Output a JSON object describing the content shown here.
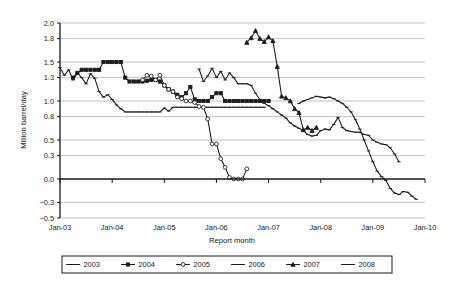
{
  "chart_data": {
    "type": "line",
    "title": "",
    "xlabel": "Report month",
    "ylabel": "Million barrel/day",
    "ylim": [
      -0.5,
      2.0
    ],
    "xlim": [
      2003.0,
      2010.0
    ],
    "grid": true,
    "legend_position": "bottom",
    "y_ticks": [
      "2.0",
      "1.8",
      "1.5",
      "1.3",
      "1.0",
      "0.8",
      "0.5",
      "0.3",
      "0.0",
      "-0.3",
      "-0.5"
    ],
    "y_tick_values": [
      2.0,
      1.8,
      1.5,
      1.3,
      1.0,
      0.8,
      0.5,
      0.3,
      0.0,
      -0.3,
      -0.5
    ],
    "x_ticks": [
      "Jan-03",
      "Jan-04",
      "Jan-05",
      "Jan-06",
      "Jan-07",
      "Jan-08",
      "Jan-09",
      "Jan-10"
    ],
    "x_tick_values": [
      2003,
      2004,
      2005,
      2006,
      2007,
      2008,
      2009,
      2010
    ],
    "series": [
      {
        "name": "2003",
        "marker": "dash",
        "x": [
          2003.0,
          2003.083,
          2003.167,
          2003.25,
          2003.333,
          2003.417,
          2003.5,
          2003.583,
          2003.667,
          2003.75,
          2003.833,
          2003.917,
          2004.0,
          2004.083,
          2004.167,
          2004.25,
          2004.333,
          2004.417,
          2004.5,
          2004.583,
          2004.667,
          2004.75,
          2004.833,
          2004.917,
          2005.0,
          2005.083,
          2005.167,
          2005.25,
          2005.333,
          2005.417,
          2005.5,
          2005.583,
          2005.667,
          2005.75,
          2005.833,
          2005.917,
          2006.0,
          2006.083,
          2006.167,
          2006.25,
          2006.333,
          2006.417,
          2006.5,
          2006.583,
          2006.667,
          2006.75,
          2006.833,
          2006.917
        ],
        "values": [
          1.43,
          1.33,
          1.4,
          1.27,
          1.36,
          1.3,
          1.22,
          1.35,
          1.29,
          1.12,
          1.05,
          1.08,
          1.02,
          0.95,
          0.9,
          0.86,
          0.86,
          0.86,
          0.86,
          0.86,
          0.86,
          0.86,
          0.86,
          0.86,
          0.91,
          0.87,
          0.92,
          0.92,
          0.92,
          0.92,
          0.92,
          0.92,
          0.92,
          0.92,
          0.92,
          0.92,
          0.92,
          0.92,
          0.92,
          0.92,
          0.92,
          0.92,
          0.92,
          0.92,
          0.92,
          0.92,
          0.92,
          0.92
        ]
      },
      {
        "name": "2004",
        "marker": "square",
        "x": [
          2003.25,
          2003.333,
          2003.417,
          2003.5,
          2003.583,
          2003.667,
          2003.75,
          2003.833,
          2003.917,
          2004.0,
          2004.083,
          2004.167,
          2004.25,
          2004.333,
          2004.417,
          2004.5,
          2004.583,
          2004.667,
          2004.75,
          2004.833,
          2004.917,
          2005.0,
          2005.083,
          2005.167,
          2005.25,
          2005.333,
          2005.417,
          2005.5,
          2005.583,
          2005.667,
          2005.75,
          2005.833,
          2005.917,
          2006.0,
          2006.083,
          2006.167,
          2006.25,
          2006.333,
          2006.417,
          2006.5,
          2006.583,
          2006.667,
          2006.75,
          2006.833,
          2006.917,
          2007.0
        ],
        "values": [
          1.3,
          1.36,
          1.4,
          1.4,
          1.4,
          1.4,
          1.4,
          1.5,
          1.5,
          1.5,
          1.5,
          1.5,
          1.3,
          1.25,
          1.25,
          1.25,
          1.25,
          1.26,
          1.27,
          1.27,
          1.25,
          1.2,
          1.15,
          1.12,
          1.08,
          1.05,
          1.1,
          1.18,
          1.02,
          1.0,
          1.0,
          1.0,
          1.05,
          1.1,
          1.1,
          1.0,
          1.0,
          1.0,
          1.0,
          1.0,
          1.0,
          1.0,
          1.0,
          1.0,
          1.0,
          1.0
        ]
      },
      {
        "name": "2005",
        "marker": "circle-open",
        "x": [
          2004.583,
          2004.667,
          2004.75,
          2004.833,
          2004.917,
          2005.0,
          2005.083,
          2005.167,
          2005.25,
          2005.333,
          2005.417,
          2005.5,
          2005.583,
          2005.667,
          2005.75,
          2005.833,
          2005.917,
          2006.0,
          2006.083,
          2006.167,
          2006.25,
          2006.333,
          2006.417,
          2006.5,
          2006.583
        ],
        "values": [
          1.27,
          1.33,
          1.32,
          1.27,
          1.33,
          1.2,
          1.15,
          1.12,
          1.05,
          1.03,
          1.0,
          1.0,
          0.98,
          0.93,
          0.92,
          0.77,
          0.45,
          0.45,
          0.26,
          0.15,
          0.02,
          0.0,
          0.0,
          0.0,
          0.13
        ]
      },
      {
        "name": "2006",
        "marker": "dash",
        "x": [
          2005.667,
          2005.75,
          2005.833,
          2005.917,
          2006.0,
          2006.083,
          2006.167,
          2006.25,
          2006.333,
          2006.417,
          2006.5,
          2006.583,
          2006.667,
          2006.75,
          2006.833,
          2006.917,
          2007.0,
          2007.083,
          2007.167,
          2007.25,
          2007.333,
          2007.417,
          2007.5,
          2007.583,
          2007.667,
          2007.75,
          2007.833,
          2007.917,
          2008.0,
          2008.083,
          2008.167,
          2008.25,
          2008.333,
          2008.417,
          2008.5,
          2008.583,
          2008.667,
          2008.75,
          2008.833,
          2008.917,
          2009.0,
          2009.083,
          2009.167,
          2009.25,
          2009.333,
          2009.417,
          2009.5
        ],
        "values": [
          1.41,
          1.25,
          1.32,
          1.42,
          1.3,
          1.38,
          1.27,
          1.36,
          1.3,
          1.22,
          1.22,
          1.22,
          1.2,
          1.1,
          1.02,
          0.97,
          0.94,
          0.9,
          0.86,
          0.82,
          0.78,
          0.72,
          0.68,
          0.65,
          0.62,
          0.57,
          0.55,
          0.56,
          0.62,
          0.64,
          0.63,
          0.7,
          0.79,
          0.66,
          0.62,
          0.61,
          0.6,
          0.6,
          0.57,
          0.56,
          0.5,
          0.47,
          0.45,
          0.44,
          0.4,
          0.32,
          0.22
        ]
      },
      {
        "name": "2007",
        "marker": "triangle",
        "x": [
          2006.583,
          2006.667,
          2006.75,
          2006.833,
          2006.917,
          2007.0,
          2007.083,
          2007.167,
          2007.25,
          2007.333,
          2007.417,
          2007.5,
          2007.583,
          2007.667,
          2007.75,
          2007.833,
          2007.917
        ],
        "values": [
          1.75,
          1.81,
          1.9,
          1.8,
          1.76,
          1.82,
          1.77,
          1.44,
          1.06,
          1.04,
          1.0,
          0.9,
          0.85,
          0.63,
          0.66,
          0.62,
          0.66
        ]
      },
      {
        "name": "2008",
        "marker": "dash",
        "x": [
          2007.583,
          2007.667,
          2007.75,
          2007.833,
          2007.917,
          2008.0,
          2008.083,
          2008.167,
          2008.25,
          2008.333,
          2008.417,
          2008.5,
          2008.583,
          2008.667,
          2008.75,
          2008.833,
          2008.917,
          2009.0,
          2009.083,
          2009.167,
          2009.25,
          2009.333,
          2009.417,
          2009.5,
          2009.583,
          2009.667,
          2009.75,
          2009.833
        ],
        "values": [
          0.97,
          1.0,
          1.02,
          1.04,
          1.06,
          1.05,
          1.04,
          1.05,
          1.03,
          1.0,
          0.97,
          0.92,
          0.86,
          0.76,
          0.64,
          0.5,
          0.36,
          0.22,
          0.1,
          0.03,
          -0.02,
          -0.12,
          -0.18,
          -0.2,
          -0.16,
          -0.17,
          -0.22,
          -0.26
        ]
      }
    ]
  },
  "legend": {
    "items": [
      {
        "label": "2003",
        "marker": "dash"
      },
      {
        "label": "2004",
        "marker": "square"
      },
      {
        "label": "2005",
        "marker": "circle-open"
      },
      {
        "label": "2006",
        "marker": "dash"
      },
      {
        "label": "2007",
        "marker": "triangle"
      },
      {
        "label": "2008",
        "marker": "dash"
      }
    ]
  },
  "colors": {
    "ink": "#1a1a1a",
    "grid": "#9a9a9a",
    "background": "#ffffff"
  }
}
